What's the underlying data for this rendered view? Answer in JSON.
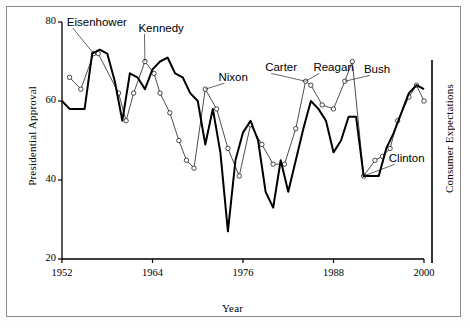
{
  "figure": {
    "left_axis_title": "Presidential Approval",
    "right_axis_title": "Consumer Expectations",
    "x_axis_title": "Year"
  },
  "chart_data": {
    "type": "line",
    "title": "",
    "xlabel": "Year",
    "ylabel": "Presidential Approval",
    "y2label": "Consumer Expectations",
    "xlim": [
      1952,
      2000
    ],
    "ylim": [
      20,
      80
    ],
    "xticks": [
      1952,
      1964,
      1976,
      1988,
      2000
    ],
    "yticks": [
      20,
      40,
      60,
      80
    ],
    "grid": false,
    "legend": "none",
    "series": [
      {
        "name": "Presidential Approval",
        "style": "thick-line-no-markers",
        "x": [
          1952.0,
          1953.0,
          1954.0,
          1955.0,
          1956.0,
          1957.0,
          1958.0,
          1959.0,
          1960.0,
          1961.0,
          1962.0,
          1963.0,
          1964.0,
          1965.0,
          1966.0,
          1967.0,
          1968.0,
          1969.0,
          1970.0,
          1971.0,
          1972.0,
          1973.0,
          1974.0,
          1975.0,
          1976.0,
          1977.0,
          1978.0,
          1979.0,
          1980.0,
          1981.0,
          1982.0,
          1983.0,
          1984.0,
          1985.0,
          1986.0,
          1987.0,
          1988.0,
          1989.0,
          1990.0,
          1991.0,
          1992.0,
          1993.0,
          1994.0,
          1995.0,
          1996.0,
          1997.0,
          1998.0,
          1999.0,
          2000.0
        ],
        "y": [
          60.0,
          58.0,
          58.0,
          58.0,
          72.0,
          73.0,
          72.0,
          65.0,
          55.0,
          67.0,
          66.0,
          63.0,
          68.0,
          70.0,
          71.0,
          67.0,
          66.0,
          62.0,
          60.0,
          49.0,
          58.0,
          47.0,
          27.0,
          45.0,
          52.0,
          55.0,
          50.0,
          37.0,
          33.0,
          45.0,
          37.0,
          45.0,
          53.0,
          60.0,
          58.0,
          55.0,
          47.0,
          50.0,
          56.0,
          56.0,
          41.0,
          41.0,
          41.0,
          48.0,
          52.0,
          57.0,
          62.0,
          64.0,
          63.0
        ]
      },
      {
        "name": "Consumer Expectations",
        "style": "thin-line-open-circle-markers",
        "x": [
          1953.0,
          1954.5,
          1956.2,
          1956.8,
          1959.5,
          1960.5,
          1961.5,
          1963.0,
          1964.2,
          1965.0,
          1966.3,
          1967.5,
          1968.5,
          1969.5,
          1971.0,
          1972.5,
          1974.0,
          1975.5,
          1977.0,
          1978.5,
          1980.0,
          1981.5,
          1983.0,
          1984.3,
          1985.0,
          1986.5,
          1988.0,
          1989.5,
          1990.5,
          1992.0,
          1993.5,
          1994.5,
          1995.5,
          1996.5,
          1998.0,
          1999.0,
          2000.0
        ],
        "y": [
          66.0,
          63.0,
          72.0,
          72.0,
          62.0,
          55.0,
          62.0,
          70.0,
          67.0,
          62.0,
          57.0,
          50.0,
          45.0,
          43.0,
          63.0,
          58.0,
          48.0,
          41.0,
          54.0,
          49.0,
          44.0,
          44.0,
          53.0,
          65.0,
          64.0,
          59.0,
          58.0,
          65.0,
          70.0,
          41.0,
          45.0,
          46.0,
          48.0,
          55.0,
          61.0,
          64.0,
          60.0
        ]
      }
    ],
    "annotations": [
      {
        "label": "Eisenhower",
        "x": 1952.9,
        "y": 79.5
      },
      {
        "label": "Kennedy",
        "x": 1962.4,
        "y": 78.0
      },
      {
        "label": "Nixon",
        "x": 1973.0,
        "y": 65.5
      },
      {
        "label": "Carter",
        "x": 1979.2,
        "y": 68.0
      },
      {
        "label": "Reagan",
        "x": 1985.6,
        "y": 68.0
      },
      {
        "label": "Bush",
        "x": 1992.3,
        "y": 67.5
      },
      {
        "label": "Clinton",
        "x": 1995.6,
        "y": 45.0
      }
    ]
  }
}
